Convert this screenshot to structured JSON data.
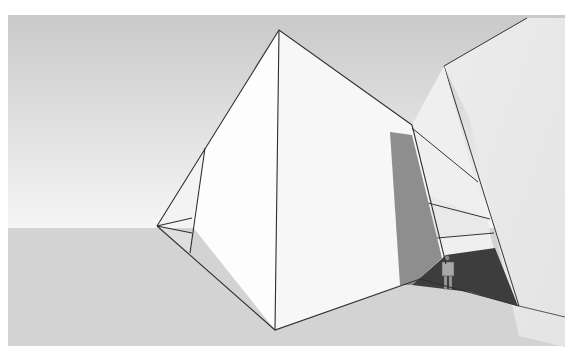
{
  "scene": {
    "description": "3D architectural model render: large faceted pyramid-like white volume with a tall tilted slab at right, a small human scale figure standing in a shadowed opening",
    "colors": {
      "sky_top": "#c8c8c8",
      "sky_bottom": "#f4f4f4",
      "ground": "#d2d2d2",
      "face_white": "#fdfdfd",
      "face_light": "#eeeeee",
      "face_mid": "#e2e2e2",
      "shadow": "#8a8a8a",
      "shadow_dark": "#3a3a3a",
      "edge": "#333333"
    }
  }
}
